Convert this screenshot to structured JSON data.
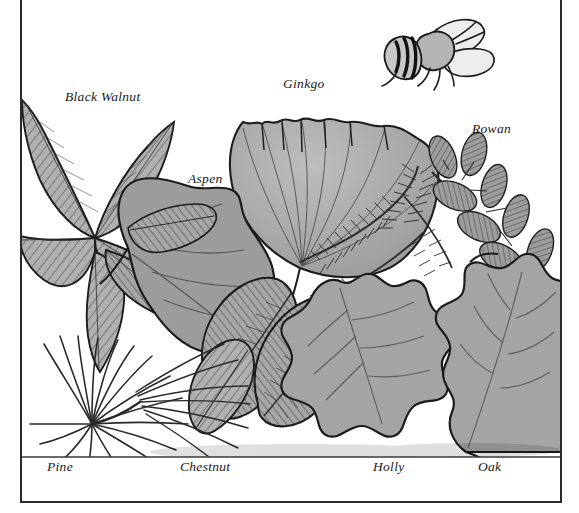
{
  "plate": {
    "title": "Leaf identification plate",
    "background_color": "#ffffff",
    "frame_color": "#2b2b2b",
    "ink_color": "#1a1a1a",
    "leaf_fill_gray": "#a2a2a2",
    "leaf_fill_light": "#b8b8b8",
    "leaf_fill_dark": "#8c8c8c",
    "ground_line_color": "#3a3a3a"
  },
  "labels": [
    {
      "id": "black-walnut",
      "text": "Black Walnut",
      "x": 65,
      "y": 89,
      "align": "left"
    },
    {
      "id": "aspen",
      "text": "Aspen",
      "x": 188,
      "y": 171,
      "align": "left"
    },
    {
      "id": "ginkgo",
      "text": "Ginkgo",
      "x": 283,
      "y": 76,
      "align": "left"
    },
    {
      "id": "rowan",
      "text": "Rowan",
      "x": 472,
      "y": 121,
      "align": "left"
    },
    {
      "id": "pine",
      "text": "Pine",
      "x": 47,
      "y": 458,
      "align": "left"
    },
    {
      "id": "chestnut",
      "text": "Chestnut",
      "x": 180,
      "y": 458,
      "align": "left"
    },
    {
      "id": "holly",
      "text": "Holly",
      "x": 373,
      "y": 458,
      "align": "left"
    },
    {
      "id": "oak",
      "text": "Oak",
      "x": 478,
      "y": 458,
      "align": "left"
    }
  ],
  "specimens": [
    {
      "name": "Black Walnut",
      "leaf_type": "compound pinnate",
      "leaflet_count": 6,
      "shading": "hatched gray"
    },
    {
      "name": "Aspen",
      "leaf_type": "simple broad ovate",
      "leaflet_count": 1,
      "shading": "solid gray"
    },
    {
      "name": "Ginkgo",
      "leaf_type": "simple fan-shaped",
      "leaflet_count": 1,
      "shading": "solid gray"
    },
    {
      "name": "Rowan",
      "leaf_type": "compound pinnate",
      "leaflet_count": 11,
      "shading": "hatched gray"
    },
    {
      "name": "Pine",
      "leaf_type": "needle cluster",
      "leaflet_count": 24,
      "shading": "line only"
    },
    {
      "name": "Chestnut",
      "leaf_type": "simple lanceolate serrate",
      "leaflet_count": 3,
      "shading": "hatched gray"
    },
    {
      "name": "Holly",
      "leaf_type": "simple spiny lobed",
      "leaflet_count": 1,
      "shading": "solid gray"
    },
    {
      "name": "Oak",
      "leaf_type": "simple lobed",
      "leaflet_count": 1,
      "shading": "solid gray"
    },
    {
      "name": "Conifer sprig",
      "leaf_type": "needled twig",
      "leaflet_count": 2,
      "shading": "line only"
    }
  ],
  "insect": {
    "name": "Bee",
    "x": 400,
    "y": 14,
    "width": 92,
    "height": 66,
    "stripes": 5,
    "wings": 2
  },
  "ground_line": {
    "y": 457,
    "x_start": 22,
    "x_end": 560
  }
}
